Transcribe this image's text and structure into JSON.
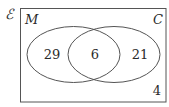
{
  "diagram": {
    "type": "venn",
    "universal_set": {
      "symbol": "ℰ"
    },
    "sets": [
      {
        "name": "M",
        "only_count": "29"
      },
      {
        "name": "C",
        "only_count": "21"
      }
    ],
    "intersection": {
      "sets": [
        "M",
        "C"
      ],
      "count": "6"
    },
    "outside": {
      "count": "4"
    },
    "colors": {
      "line": "#555555",
      "text": "#2a2a2a",
      "background": "#ffffff"
    }
  }
}
